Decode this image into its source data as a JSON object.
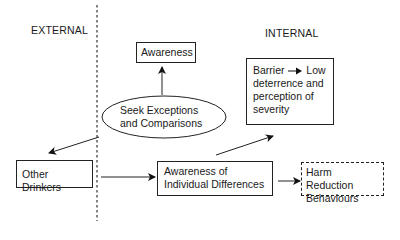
{
  "regions": {
    "external_label": "EXTERNAL",
    "internal_label": "INTERNAL"
  },
  "nodes": {
    "awareness": "Awareness",
    "seek": {
      "line1": "Seek Exceptions",
      "line2": "and Comparisons"
    },
    "barrier": {
      "lead": "Barrier",
      "after_arrow": "Low",
      "line2": "deterrence and",
      "line3": "perception of",
      "line4": "severity"
    },
    "other_drinkers": "Other Drinkers",
    "individual_diff": {
      "line1": "Awareness of",
      "line2": "Individual Differences"
    },
    "harm_reduction": {
      "line1": "Harm Reduction",
      "line2": "Behaviours"
    }
  },
  "edges": [
    {
      "from": "Seek Exceptions and Comparisons",
      "to": "Awareness"
    },
    {
      "from": "Seek Exceptions and Comparisons",
      "to": "Other Drinkers"
    },
    {
      "from": "Other Drinkers",
      "to": "Awareness of Individual Differences"
    },
    {
      "from": "Awareness of Individual Differences",
      "to": "Barrier - Low deterrence and perception of severity"
    },
    {
      "from": "Awareness of Individual Differences",
      "to": "Harm Reduction Behaviours"
    }
  ]
}
